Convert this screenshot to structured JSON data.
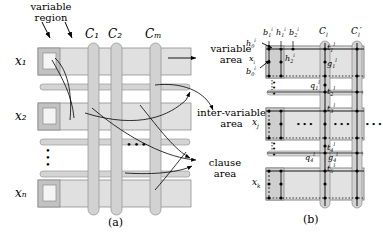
{
  "figure": {
    "panel_a": {
      "caption": "(a)",
      "annotations": {
        "variable_region": "variable\nregion",
        "variable_area": "variable\narea",
        "inter_variable_area": "inter-variable\narea",
        "clause_area": "clause\narea"
      },
      "row_labels": [
        "x1",
        "x2",
        "xn"
      ],
      "row_labels_display": [
        "x₁",
        "x₂",
        "xₙ"
      ],
      "column_labels": [
        "C1",
        "C2",
        "Cm"
      ],
      "column_labels_display": [
        "C₁",
        "C₂",
        "Cₘ"
      ],
      "vertical_ellipsis": "⋮",
      "horizontal_ellipsis": "•••"
    },
    "panel_b": {
      "caption": "(b)",
      "column_labels": [
        "Cl",
        "Cl'"
      ],
      "row_labels": [
        "xi",
        "xj",
        "xk"
      ],
      "node_labels_top": [
        "b1i",
        "h1i",
        "b2i"
      ],
      "node_labels_left": [
        "h0i",
        "xi",
        "b0i"
      ],
      "node_labels_inner": [
        "h2i",
        "t1l",
        "g1l",
        "q1l",
        "t2l",
        "t3l",
        "t4l",
        "q4l",
        "g4l",
        "t5l"
      ],
      "ellipsis": "•••",
      "vertical_ellipsis": "⋮"
    }
  },
  "colors": {
    "area_fill": "#d9d9d9",
    "area_fill_light": "#e6e6e6",
    "bar_fill": "#cccccc",
    "inner_box": "#bfbfbf",
    "inner_box_white": "#f2f2f2",
    "stroke": "#000000",
    "gray_stroke": "#999999"
  }
}
